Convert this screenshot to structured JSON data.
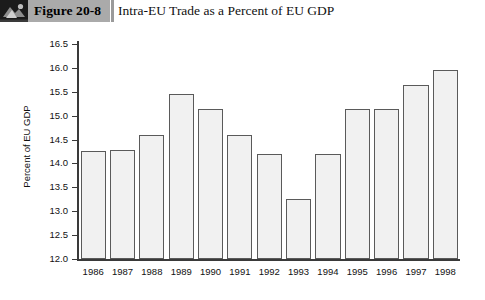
{
  "header": {
    "icon_name": "figure-photo-icon",
    "figure_label": "Figure 20-8",
    "title": "Intra-EU Trade as a Percent of EU GDP"
  },
  "chart_data": {
    "type": "bar",
    "title": "Intra-EU Trade as a Percent of EU GDP",
    "xlabel": "",
    "ylabel": "Percent of EU GDP",
    "ylim": [
      12.0,
      16.5
    ],
    "ytick_step": 0.5,
    "ytick_labels": [
      "16.5",
      "16.0",
      "15.5",
      "15.0",
      "14.5",
      "14.0",
      "13.5",
      "13.0",
      "12.5",
      "12.0"
    ],
    "grid": false,
    "legend": null,
    "bar_fill_color": "#f1f1f1",
    "bar_edge_color": "#5a5a5a",
    "categories": [
      "1986",
      "1987",
      "1988",
      "1989",
      "1990",
      "1991",
      "1992",
      "1993",
      "1994",
      "1995",
      "1996",
      "1997",
      "1998"
    ],
    "values": [
      14.27,
      14.29,
      14.59,
      15.45,
      15.14,
      14.59,
      14.19,
      13.26,
      14.19,
      15.15,
      15.15,
      15.64,
      15.95
    ]
  }
}
